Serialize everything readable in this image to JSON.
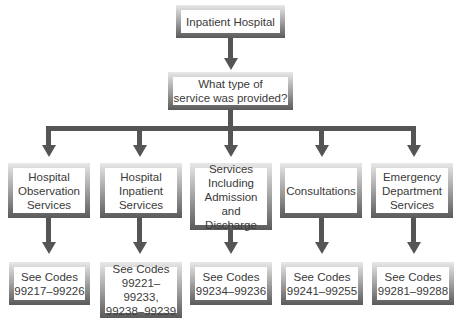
{
  "diagram": {
    "root": {
      "label": "Inpatient Hospital"
    },
    "question": {
      "label": "What type of\nservice was provided?"
    },
    "categories": [
      {
        "label": "Hospital\nObservation\nServices",
        "codes": "See Codes\n99217–99226"
      },
      {
        "label": "Hospital\nInpatient\nServices",
        "codes": "See Codes\n99221–99233,\n99238–99239"
      },
      {
        "label": "Services\nIncluding\nAdmission\nand Discharge",
        "codes": "See Codes\n99234–99236"
      },
      {
        "label": "Consultations",
        "codes": "See Codes\n99241–99255"
      },
      {
        "label": "Emergency\nDepartment\nServices",
        "codes": "See Codes\n99281–99288"
      }
    ],
    "colors": {
      "connector": "#555555",
      "text": "#3a3a3a",
      "frame_dark": "#5a5a5a",
      "frame_light": "#e8e8e8"
    }
  }
}
